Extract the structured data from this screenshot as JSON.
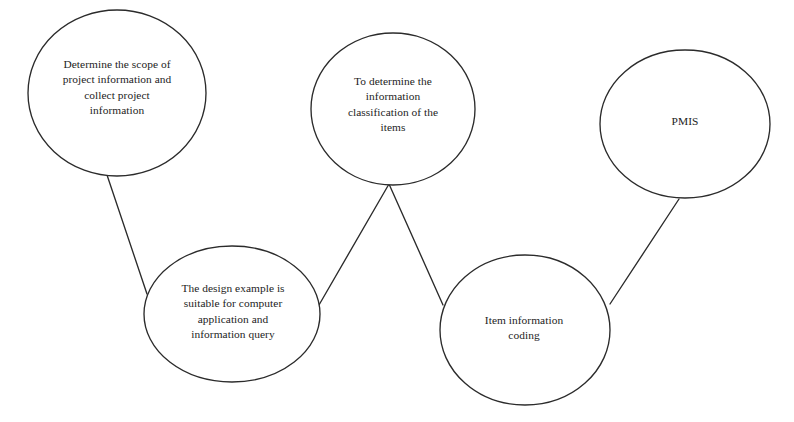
{
  "diagram": {
    "background_color": "#ffffff",
    "stroke_color": "#2b2b2b",
    "text_color": "#1d1d1d",
    "nodes": [
      {
        "id": "scope-collection",
        "label": "Determine the scope of\nproject information and\ncollect project\ninformation",
        "cx": 117,
        "cy": 93,
        "rx": 89,
        "ry": 83,
        "text_cx": 117,
        "text_cy": 88,
        "text_width": 160
      },
      {
        "id": "information-classification",
        "label": "To determine the\ninformation\nclassification of the\nitems",
        "cx": 393,
        "cy": 109,
        "rx": 82,
        "ry": 76,
        "text_cx": 393,
        "text_cy": 105,
        "text_width": 138
      },
      {
        "id": "design-example",
        "label": "The design example is\nsuitable for computer\napplication and\ninformation query",
        "cx": 232,
        "cy": 314,
        "rx": 88,
        "ry": 68,
        "text_cx": 233,
        "text_cy": 312,
        "text_width": 152
      },
      {
        "id": "item-information-coding",
        "label": "Item information\ncoding",
        "cx": 525,
        "cy": 330,
        "rx": 85,
        "ry": 75,
        "text_cx": 524,
        "text_cy": 328,
        "text_width": 140
      },
      {
        "id": "pmis",
        "label": "PMIS",
        "cx": 685,
        "cy": 124,
        "rx": 85,
        "ry": 74,
        "text_cx": 685,
        "text_cy": 122,
        "text_width": 100
      }
    ],
    "connectors": [
      {
        "id": "scope-to-design-example",
        "from": "scope-collection",
        "to": "design-example",
        "x1": 105,
        "y1": 169,
        "x2": 147,
        "y2": 294
      },
      {
        "id": "classification-to-design-example",
        "from": "information-classification",
        "to": "design-example",
        "x1": 389,
        "y1": 184,
        "x2": 319,
        "y2": 305
      },
      {
        "id": "classification-to-item-coding",
        "from": "information-classification",
        "to": "item-information-coding",
        "x1": 389,
        "y1": 184,
        "x2": 443,
        "y2": 305
      },
      {
        "id": "pmis-to-item-coding",
        "from": "pmis",
        "to": "item-information-coding",
        "x1": 679,
        "y1": 199,
        "x2": 610,
        "y2": 304
      }
    ]
  }
}
